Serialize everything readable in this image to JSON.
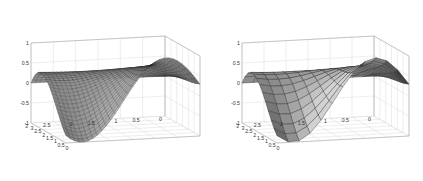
{
  "chart_data": [
    {
      "type": "surface",
      "panel": "left",
      "title": "",
      "xlabel": "",
      "ylabel": "",
      "zlabel": "",
      "z_ticks": [
        "-1",
        "-0.5",
        "0",
        "0.5",
        "1"
      ],
      "x_ticks": [
        "0",
        "0.5",
        "1",
        "1.5",
        "2",
        "2.5",
        "3"
      ],
      "y_ticks": [
        "0",
        "0.5",
        "1",
        "1.5",
        "2",
        "2.5",
        "3"
      ],
      "xlim": [
        0,
        3
      ],
      "ylim": [
        0,
        3
      ],
      "zlim": [
        -1,
        1
      ],
      "grid": true,
      "style": "mesh",
      "description": "Smooth mesh surface: z = sin-like wave over x with amplitude decaying toward a flat ridge along y",
      "mesh_resolution": 30
    },
    {
      "type": "surface",
      "panel": "right",
      "title": "",
      "xlabel": "",
      "ylabel": "",
      "zlabel": "",
      "z_ticks": [
        "-1",
        "-0.5",
        "0",
        "0.5",
        "1"
      ],
      "x_ticks": [
        "0",
        "0.5",
        "1",
        "1.5",
        "2",
        "2.5",
        "3"
      ],
      "y_ticks": [
        "0",
        "0.5",
        "1",
        "1.5",
        "2",
        "2.5",
        "3"
      ],
      "xlim": [
        0,
        3
      ],
      "ylim": [
        0,
        3
      ],
      "zlim": [
        -1,
        1
      ],
      "grid": true,
      "style": "mesh",
      "description": "Same surface on a coarser grid (faceted peak)",
      "mesh_resolution": 12
    }
  ],
  "panels": [
    {
      "id": "left",
      "offset_x": 0
    },
    {
      "id": "right",
      "offset_x": 212
    }
  ],
  "colors": {
    "mesh_dark": "#1e1e1e",
    "mesh_light": "#bdbdbd",
    "grid": "#d8d8d8",
    "background": "#ffffff"
  }
}
